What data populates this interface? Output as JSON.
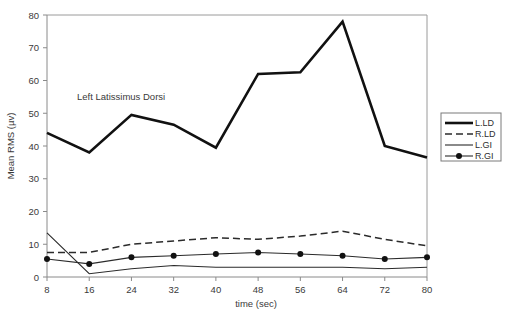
{
  "chart_data": {
    "type": "line",
    "title": "",
    "annotation": "Left Latissimus Dorsi",
    "xlabel": "time (sec)",
    "ylabel": "Mean RMS (µv)",
    "x": [
      8,
      16,
      24,
      32,
      40,
      48,
      56,
      64,
      72,
      80
    ],
    "xticklabels": [
      "8",
      "16",
      "24",
      "32",
      "40",
      "48",
      "56",
      "64",
      "72",
      "80"
    ],
    "yticks": [
      0,
      10,
      20,
      30,
      40,
      50,
      60,
      70,
      80
    ],
    "yticklabels": [
      "0",
      "10",
      "20",
      "30",
      "40",
      "50",
      "60",
      "70",
      "80"
    ],
    "xlim": [
      8,
      80
    ],
    "ylim": [
      0,
      80
    ],
    "grid": false,
    "legend_position": "right-outside",
    "series": [
      {
        "name": "L.LD",
        "style": "thick-solid",
        "color": "#111111",
        "values": [
          44,
          38,
          49.5,
          46.5,
          39.5,
          62,
          62.5,
          78,
          40,
          36.5
        ]
      },
      {
        "name": "R.LD",
        "style": "dashed",
        "color": "#2b2b2b",
        "values": [
          7.5,
          7.5,
          10,
          11,
          12,
          11.5,
          12.5,
          14,
          11.5,
          9.5
        ]
      },
      {
        "name": "L.GI",
        "style": "thin-solid",
        "color": "#2b2b2b",
        "values": [
          13.5,
          1,
          2.5,
          3.5,
          3,
          3,
          3,
          3,
          2.5,
          3
        ]
      },
      {
        "name": "R.GI",
        "style": "solid-with-markers",
        "color": "#2b2b2b",
        "values": [
          5.5,
          4,
          6,
          6.5,
          7,
          7.5,
          7,
          6.5,
          5.5,
          6
        ]
      }
    ]
  },
  "legend": {
    "entries": [
      {
        "label": "L.LD"
      },
      {
        "label": "R.LD"
      },
      {
        "label": "L.GI"
      },
      {
        "label": "R.GI"
      }
    ]
  }
}
